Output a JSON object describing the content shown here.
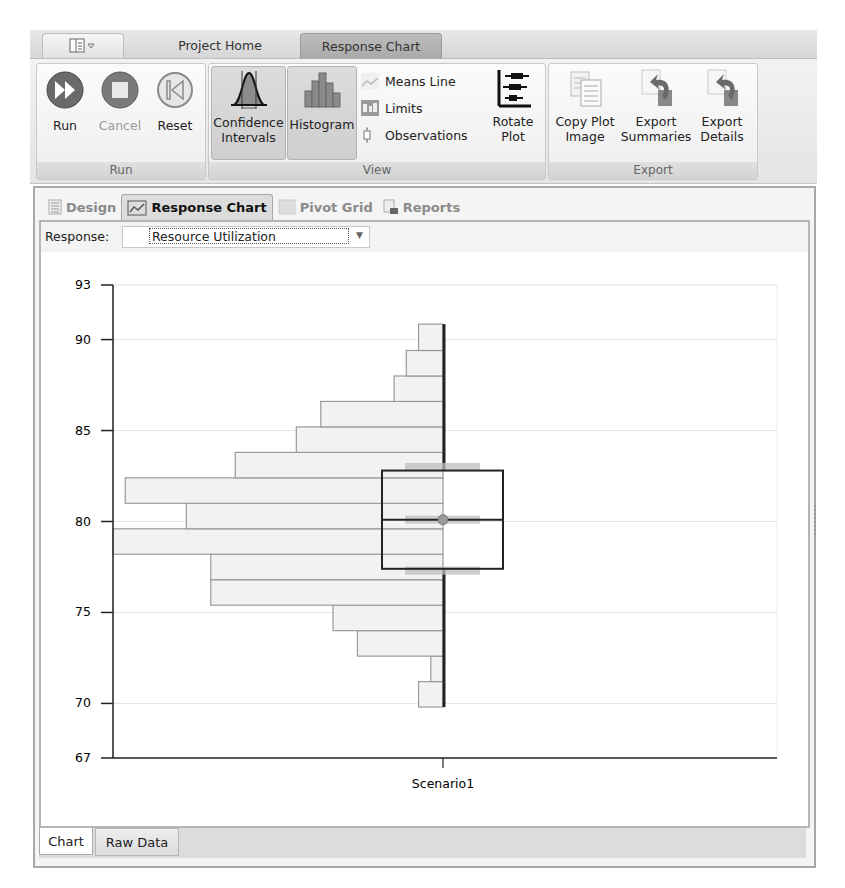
{
  "app": {
    "quick_access_icon": "layout-dropdown-icon",
    "top_tabs": [
      {
        "label": "Project Home",
        "active": false
      },
      {
        "label": "Response Chart",
        "active": true
      }
    ]
  },
  "ribbon": {
    "groups": [
      {
        "label": "Run",
        "buttons": [
          {
            "label": "Run",
            "icon": "fast-forward-icon",
            "enabled": true
          },
          {
            "label": "Cancel",
            "icon": "stop-icon",
            "enabled": false
          },
          {
            "label": "Reset",
            "icon": "rewind-start-icon",
            "enabled": true
          }
        ]
      },
      {
        "label": "View",
        "buttons": [
          {
            "label_line1": "Confidence",
            "label_line2": "Intervals",
            "icon": "bell-curve-icon",
            "pressed": true
          },
          {
            "label": "Histogram",
            "icon": "histogram-icon",
            "pressed": true
          },
          {
            "label": "Means Line",
            "icon": "means-line-icon",
            "pressed": false
          },
          {
            "label": "Limits",
            "icon": "limits-icon",
            "pressed": false
          },
          {
            "label": "Observations",
            "icon": "observations-icon",
            "pressed": false
          },
          {
            "label_line1": "Rotate",
            "label_line2": "Plot",
            "icon": "rotate-plot-icon",
            "pressed": false
          }
        ]
      },
      {
        "label": "Export",
        "buttons": [
          {
            "label_line1": "Copy Plot",
            "label_line2": "Image",
            "icon": "copy-documents-icon"
          },
          {
            "label_line1": "Export",
            "label_line2": "Summaries",
            "icon": "export-arrow-icon"
          },
          {
            "label_line1": "Export",
            "label_line2": "Details",
            "icon": "export-arrow-icon"
          }
        ]
      }
    ]
  },
  "document_tabs": [
    {
      "label": "Design",
      "icon": "design-list-icon",
      "active": false
    },
    {
      "label": "Response Chart",
      "icon": "chart-icon",
      "active": true
    },
    {
      "label": "Pivot Grid",
      "icon": "grid-icon",
      "active": false
    },
    {
      "label": "Reports",
      "icon": "report-icon",
      "active": false
    }
  ],
  "response": {
    "label": "Response:",
    "selected": "Resource Utilization"
  },
  "bottom_tabs": [
    {
      "label": "Chart",
      "active": true
    },
    {
      "label": "Raw Data",
      "active": false
    }
  ],
  "colors": {
    "bar_fill": "#f2f2f2",
    "bar_stroke": "#9a9a9a",
    "whisker": "#222222",
    "box_stroke": "#222222",
    "ci_band": "#bdbdbd",
    "grid": "#e6e6e6"
  },
  "chart_data": {
    "type": "box-histogram",
    "title": "",
    "xlabel": "",
    "ylabel": "",
    "categories": [
      "Scenario1"
    ],
    "ylim": [
      67,
      93
    ],
    "yticks": [
      67,
      70,
      75,
      80,
      85,
      90,
      93
    ],
    "grid": true,
    "legend": null,
    "histogram": {
      "bin_edges": [
        69.8,
        71.2,
        72.6,
        74.0,
        75.4,
        76.8,
        78.2,
        79.6,
        81.0,
        82.4,
        83.8,
        85.2,
        86.6,
        88.0,
        89.4,
        90.85
      ],
      "counts": [
        2,
        1,
        7,
        9,
        19,
        19,
        27,
        21,
        26,
        17,
        12,
        10,
        4,
        3,
        2
      ]
    },
    "box": {
      "min": 69.8,
      "q1": 77.4,
      "median": 80.1,
      "mean": 80.1,
      "q3": 82.8,
      "max": 90.85
    },
    "confidence_intervals": {
      "q1": 77.3,
      "mean": 80.1,
      "q3": 83.0
    }
  }
}
